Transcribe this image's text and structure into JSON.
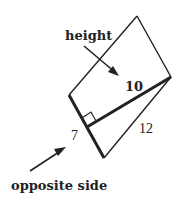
{
  "diagram": {
    "labels": {
      "height": "height",
      "height_value": "10",
      "opposite_side": "opposite side",
      "opposite_value": "7",
      "slant_side_value": "12"
    },
    "colors": {
      "stroke": "#222222",
      "background": "#ffffff"
    }
  }
}
